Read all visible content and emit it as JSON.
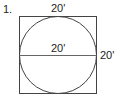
{
  "problem_number": "1.",
  "labels": {
    "top": "20'",
    "diameter": "20'",
    "right": "20'"
  },
  "colors": {
    "stroke": "#444444",
    "text": "#222222"
  }
}
